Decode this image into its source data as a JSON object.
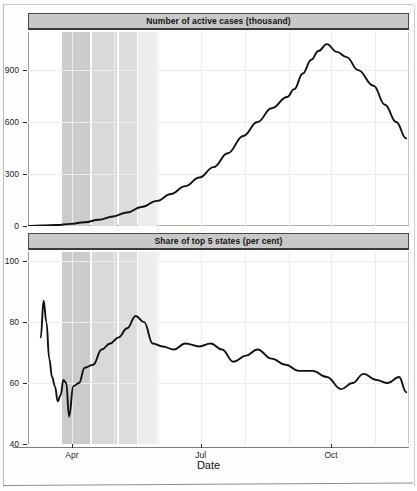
{
  "figure": {
    "axis_title_x": "Date",
    "panels": [
      {
        "strip_label": "Number of active cases (thousand)",
        "y_ticks": [
          "900",
          "600",
          "300",
          "0"
        ]
      },
      {
        "strip_label": "Share of top 5 states (per cent)",
        "y_ticks": [
          "100",
          "80",
          "60",
          "40"
        ]
      }
    ],
    "x_ticks": [
      "Apr",
      "Jul",
      "Oct"
    ]
  },
  "colors": {
    "strip_fill": "#c8c8c8",
    "strip_border": "#3a3a3a",
    "line": "#111111",
    "grid": "#ededed",
    "band_1": "#d9d9d9",
    "band_2": "#cbcbcb",
    "band_3": "#dcdcdc",
    "band_4": "#ededed",
    "background": "#ffffff"
  },
  "chart_data": [
    {
      "type": "line",
      "title": "Number of active cases (thousand)",
      "xlabel": "Date",
      "ylabel": "Number of active cases (thousand)",
      "ylim": [
        0,
        1120
      ],
      "yticks": [
        0,
        300,
        600,
        900
      ],
      "xlim": [
        "2020-03-01",
        "2020-11-25"
      ],
      "xticks": [
        "Apr",
        "Jul",
        "Oct"
      ],
      "grid": true,
      "legend": "none",
      "annotations": [
        {
          "label": "Lockdown phase 1",
          "x_start": "2020-03-25",
          "x_end": "2020-04-14",
          "shade": "#cbcbcb"
        },
        {
          "label": "Lockdown phase 2",
          "x_start": "2020-04-15",
          "x_end": "2020-05-03",
          "shade": "#d9d9d9"
        },
        {
          "label": "Lockdown phase 3",
          "x_start": "2020-05-04",
          "x_end": "2020-05-17",
          "shade": "#dcdcdc"
        },
        {
          "label": "Lockdown phase 4",
          "x_start": "2020-05-18",
          "x_end": "2020-05-31",
          "shade": "#ededed"
        }
      ],
      "x": [
        "2020-03-01",
        "2020-03-11",
        "2020-03-21",
        "2020-03-31",
        "2020-04-10",
        "2020-04-20",
        "2020-04-30",
        "2020-05-10",
        "2020-05-20",
        "2020-05-31",
        "2020-06-10",
        "2020-06-20",
        "2020-06-30",
        "2020-07-10",
        "2020-07-20",
        "2020-07-31",
        "2020-08-10",
        "2020-08-20",
        "2020-08-31",
        "2020-09-05",
        "2020-09-11",
        "2020-09-17",
        "2020-09-22",
        "2020-09-28",
        "2020-10-05",
        "2020-10-12",
        "2020-10-20",
        "2020-10-31",
        "2020-11-08",
        "2020-11-16",
        "2020-11-23"
      ],
      "values": [
        1,
        3,
        6,
        12,
        22,
        36,
        55,
        78,
        110,
        145,
        185,
        230,
        280,
        340,
        420,
        520,
        600,
        680,
        745,
        790,
        880,
        960,
        1010,
        1050,
        1005,
        975,
        900,
        810,
        700,
        600,
        505
      ]
    },
    {
      "type": "line",
      "title": "Share of top 5 states (per cent)",
      "xlabel": "Date",
      "ylabel": "Share of top 5 states (per cent)",
      "ylim": [
        40,
        103
      ],
      "yticks": [
        40,
        60,
        80,
        100
      ],
      "xlim": [
        "2020-03-01",
        "2020-11-25"
      ],
      "xticks": [
        "Apr",
        "Jul",
        "Oct"
      ],
      "grid": true,
      "legend": "none",
      "annotations": [
        {
          "label": "Lockdown phase 1",
          "x_start": "2020-03-25",
          "x_end": "2020-04-14",
          "shade": "#cbcbcb"
        },
        {
          "label": "Lockdown phase 2",
          "x_start": "2020-04-15",
          "x_end": "2020-05-03",
          "shade": "#d9d9d9"
        },
        {
          "label": "Lockdown phase 3",
          "x_start": "2020-05-04",
          "x_end": "2020-05-17",
          "shade": "#dcdcdc"
        },
        {
          "label": "Lockdown phase 4",
          "x_start": "2020-05-18",
          "x_end": "2020-05-31",
          "shade": "#ededed"
        }
      ],
      "x": [
        "2020-03-10",
        "2020-03-12",
        "2020-03-14",
        "2020-03-16",
        "2020-03-18",
        "2020-03-20",
        "2020-03-22",
        "2020-03-24",
        "2020-03-26",
        "2020-03-28",
        "2020-03-30",
        "2020-04-02",
        "2020-04-06",
        "2020-04-10",
        "2020-04-16",
        "2020-04-22",
        "2020-04-28",
        "2020-05-04",
        "2020-05-10",
        "2020-05-16",
        "2020-05-22",
        "2020-05-28",
        "2020-06-04",
        "2020-06-12",
        "2020-06-20",
        "2020-06-30",
        "2020-07-08",
        "2020-07-16",
        "2020-07-24",
        "2020-08-02",
        "2020-08-10",
        "2020-08-20",
        "2020-08-30",
        "2020-09-08",
        "2020-09-18",
        "2020-09-28",
        "2020-10-08",
        "2020-10-16",
        "2020-10-24",
        "2020-11-02",
        "2020-11-10",
        "2020-11-18",
        "2020-11-23"
      ],
      "values": [
        75,
        87,
        80,
        68,
        62,
        59,
        54,
        56,
        61,
        60,
        49,
        59,
        60,
        65,
        66,
        71,
        73,
        75,
        78,
        82,
        80,
        73,
        72,
        71,
        73,
        72,
        73,
        71,
        67,
        69,
        71,
        68,
        66,
        64,
        64,
        62,
        58,
        60,
        63,
        61,
        60,
        62,
        57
      ]
    }
  ]
}
